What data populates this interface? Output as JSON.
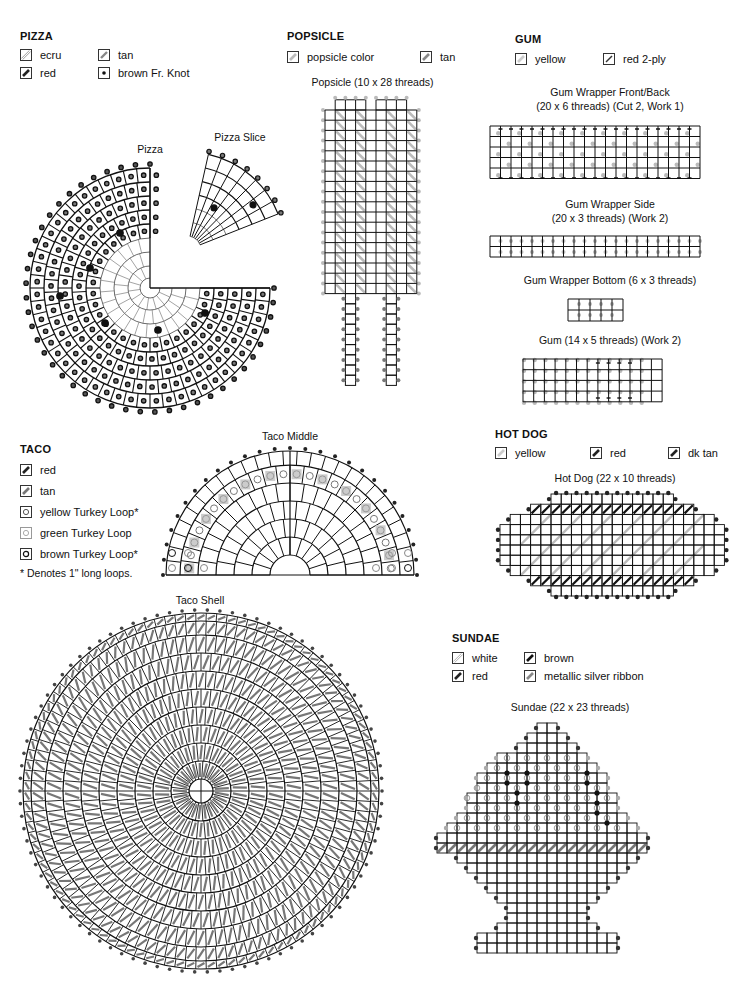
{
  "pizza": {
    "title": "PIZZA",
    "legend": [
      {
        "label": "ecru",
        "swatch": "diagonal-outline-light"
      },
      {
        "label": "tan",
        "swatch": "diagonal-gray"
      },
      {
        "label": "red",
        "swatch": "diagonal-dark"
      },
      {
        "label": "brown Fr. Knot",
        "swatch": "dot"
      }
    ],
    "pizza_caption": "Pizza",
    "slice_caption": "Pizza Slice"
  },
  "popsicle": {
    "title": "POPSICLE",
    "legend": [
      {
        "label": "popsicle color",
        "swatch": "diagonal-light"
      },
      {
        "label": "tan",
        "swatch": "diagonal-gray"
      }
    ],
    "caption": "Popsicle (10 x 28 threads)"
  },
  "gum": {
    "title": "GUM",
    "legend": [
      {
        "label": "yellow",
        "swatch": "diagonal-light"
      },
      {
        "label": "red 2-ply",
        "swatch": "thin-diagonal-dark"
      }
    ],
    "wrapper_front_caption_1": "Gum Wrapper Front/Back",
    "wrapper_front_caption_2": "(20 x 6 threads) (Cut 2, Work 1)",
    "wrapper_side_caption_1": "Gum Wrapper Side",
    "wrapper_side_caption_2": "(20 x 3 threads) (Work 2)",
    "wrapper_bottom_caption": "Gum Wrapper Bottom (6 x 3 threads)",
    "gum_caption": "Gum (14 x 5 threads) (Work 2)"
  },
  "taco": {
    "title": "TACO",
    "legend": [
      {
        "label": "red",
        "swatch": "diagonal-dark"
      },
      {
        "label": "tan",
        "swatch": "diagonal-gray"
      },
      {
        "label": "yellow Turkey Loop*",
        "swatch": "circle-mid"
      },
      {
        "label": "green Turkey Loop",
        "swatch": "circle-light"
      },
      {
        "label": "brown Turkey Loop*",
        "swatch": "circle-dark"
      }
    ],
    "footnote": "* Denotes 1\" long loops.",
    "middle_caption": "Taco Middle",
    "shell_caption": "Taco Shell"
  },
  "hotdog": {
    "title": "HOT DOG",
    "legend": [
      {
        "label": "yellow",
        "swatch": "diagonal-light"
      },
      {
        "label": "red",
        "swatch": "diagonal-dark"
      },
      {
        "label": "dk tan",
        "swatch": "diagonal-dark"
      }
    ],
    "caption": "Hot Dog (22 x 10 threads)"
  },
  "sundae": {
    "title": "SUNDAE",
    "legend": [
      {
        "label": "white",
        "swatch": "diagonal-outline-light"
      },
      {
        "label": "brown",
        "swatch": "diagonal-dark"
      },
      {
        "label": "red",
        "swatch": "diagonal-dark"
      },
      {
        "label": "metallic silver ribbon",
        "swatch": "diagonal-gray"
      }
    ],
    "caption": "Sundae (22 x 23 threads)"
  },
  "colors": {
    "grid_line": "#111111",
    "stitch_dark": "#222222",
    "stitch_gray": "#777777",
    "stitch_light": "#bbbbbb",
    "loop_fill": "#cccccc"
  }
}
